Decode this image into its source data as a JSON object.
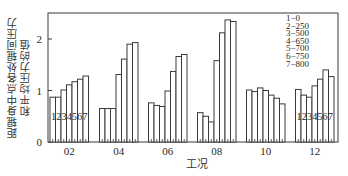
{
  "chart_data": {
    "type": "bar",
    "title": "",
    "xlabel": "工况",
    "ylabel": "距辊身中点各处辊间压力和平均压力的值",
    "ylabel_lines": [
      "距辊身中点各处辊间压力",
      "和平均压力的值"
    ],
    "ylim": [
      0,
      2.5
    ],
    "yticks": [
      0,
      1,
      2
    ],
    "ytick_labels": [
      "0",
      "1",
      "2"
    ],
    "categories": [
      "02",
      "04",
      "06",
      "08",
      "10",
      "12"
    ],
    "grid": false,
    "legend_position": "upper right",
    "legend": [
      {
        "id": "1",
        "label": "1−0"
      },
      {
        "id": "2",
        "label": "2−250"
      },
      {
        "id": "3",
        "label": "3−500"
      },
      {
        "id": "4",
        "label": "4−650"
      },
      {
        "id": "5",
        "label": "5−700"
      },
      {
        "id": "6",
        "label": "6−750"
      },
      {
        "id": "7",
        "label": "7−800"
      }
    ],
    "series": [
      {
        "name": "1−0",
        "values": [
          0.87,
          0.65,
          0.76,
          0.57,
          1.01,
          1.02
        ]
      },
      {
        "name": "2−250",
        "values": [
          0.87,
          0.65,
          0.71,
          0.5,
          0.98,
          0.91
        ]
      },
      {
        "name": "3−500",
        "values": [
          1.01,
          0.65,
          0.69,
          0.39,
          1.05,
          0.87
        ]
      },
      {
        "name": "4−650",
        "values": [
          1.11,
          1.31,
          0.99,
          1.58,
          1.0,
          1.09
        ]
      },
      {
        "name": "5−700",
        "values": [
          1.17,
          1.61,
          1.37,
          2.12,
          0.91,
          1.22
        ]
      },
      {
        "name": "6−750",
        "values": [
          1.22,
          1.9,
          1.66,
          2.37,
          0.85,
          1.4
        ]
      },
      {
        "name": "7−800",
        "values": [
          1.28,
          1.93,
          1.7,
          2.34,
          0.74,
          1.27
        ]
      }
    ],
    "bar_index_annotation": "1234567",
    "bar_index_annotation_groups": [
      "02",
      "12"
    ]
  },
  "colors": {
    "bar_fill": "#ffffff",
    "bar_stroke": "#3a3a3a",
    "axis": "#3a3a3a",
    "text": "#2a2a2a"
  }
}
